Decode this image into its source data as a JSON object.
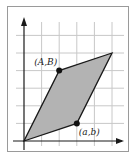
{
  "figure": {
    "type": "parallelogram-on-grid",
    "grid": {
      "x_range": [
        0,
        5
      ],
      "y_range": [
        0,
        6
      ]
    },
    "axes": {
      "x_arrow": true,
      "y_arrow": true
    },
    "vertices": [
      {
        "id": "origin",
        "x": 0,
        "y": 0,
        "label": ""
      },
      {
        "id": "ab",
        "x": 3,
        "y": 1,
        "label": "(a,b)",
        "marked": true
      },
      {
        "id": "sum",
        "x": 5,
        "y": 5,
        "label": ""
      },
      {
        "id": "AB",
        "x": 2,
        "y": 4,
        "label": "(A,B)",
        "marked": true
      }
    ],
    "colors": {
      "fill": "#b3b3b3",
      "stroke": "#1a1a1a",
      "grid": "#c8c8c8",
      "frame": "#9a9a9a"
    }
  },
  "labels": {
    "point_ab": "(a,b)",
    "point_AB": "(A,B)"
  }
}
